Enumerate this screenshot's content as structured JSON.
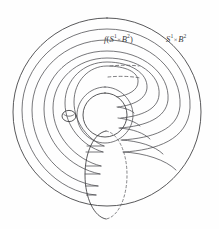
{
  "figure": {
    "background_color": "#fefefe",
    "ink_color": "#3a3a3c",
    "hidden_line_color": "#5d5d61"
  },
  "labels": {
    "image_torus": {
      "f": "f",
      "open_paren": "(",
      "s": "S",
      "s_exp": "1",
      "times": "×",
      "b": "B",
      "b_exp": "2",
      "close_paren": ")",
      "plain": "f(S1 × B2)"
    },
    "ambient_torus": {
      "s": "S",
      "s_exp": "1",
      "times": "×",
      "b": "B",
      "b_exp": "2",
      "plain": "S1 × B2"
    }
  },
  "geometry": {
    "canvas": {
      "width": 219,
      "height": 229
    },
    "outer_circle": {
      "cx": 107,
      "cy": 112,
      "r": 94
    },
    "inner_hole_circle": {
      "cx": 105,
      "cy": 115,
      "r": 22
    },
    "small_meridian_ellipse": {
      "cx": 69,
      "cy": 116,
      "rx": 7,
      "ry": 5.5
    },
    "bottom_meridian_ellipse": {
      "cx": 106,
      "cy": 175,
      "rx": 21,
      "ry": 44
    },
    "spiral_turns": 4
  }
}
